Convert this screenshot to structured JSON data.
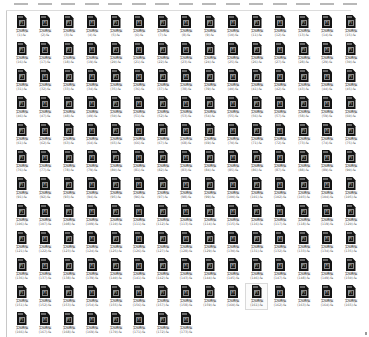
{
  "view": {
    "type": "file-explorer-icon-grid",
    "columns": 15,
    "hovered_item_index": 160
  },
  "file": {
    "base_name": "实验数据",
    "extension": ".fa",
    "icon": "fasta-file-icon",
    "icon_glyph": "Fl"
  },
  "items": [
    {
      "line1": "实验数据",
      "line2": "(1).fa"
    },
    {
      "line1": "实验数据",
      "line2": "(2).fa"
    },
    {
      "line1": "实验数据",
      "line2": "(3).fa"
    },
    {
      "line1": "实验数据",
      "line2": "(4).fa"
    },
    {
      "line1": "实验数据",
      "line2": "(5).fa"
    },
    {
      "line1": "实验数据",
      "line2": "(6).fa"
    },
    {
      "line1": "实验数据",
      "line2": "(7).fa"
    },
    {
      "line1": "实验数据",
      "line2": "(8).fa"
    },
    {
      "line1": "实验数据",
      "line2": "(9).fa"
    },
    {
      "line1": "实验数据",
      "line2": "(10).fa"
    },
    {
      "line1": "实验数据",
      "line2": "(11).fa"
    },
    {
      "line1": "实验数据",
      "line2": "(12).fa"
    },
    {
      "line1": "实验数据",
      "line2": "(13).fa"
    },
    {
      "line1": "实验数据",
      "line2": "(14).fa"
    },
    {
      "line1": "实验数据",
      "line2": "(15).fa"
    },
    {
      "line1": "实验数据",
      "line2": "(16).fa"
    },
    {
      "line1": "实验数据",
      "line2": "(17).fa"
    },
    {
      "line1": "实验数据",
      "line2": "(18).fa"
    },
    {
      "line1": "实验数据",
      "line2": "(19).fa"
    },
    {
      "line1": "实验数据",
      "line2": "(20).fa"
    },
    {
      "line1": "实验数据",
      "line2": "(21).fa"
    },
    {
      "line1": "实验数据",
      "line2": "(22).fa"
    },
    {
      "line1": "实验数据",
      "line2": "(23).fa"
    },
    {
      "line1": "实验数据",
      "line2": "(24).fa"
    },
    {
      "line1": "实验数据",
      "line2": "(25).fa"
    },
    {
      "line1": "实验数据",
      "line2": "(26).fa"
    },
    {
      "line1": "实验数据",
      "line2": "(27).fa"
    },
    {
      "line1": "实验数据",
      "line2": "(28).fa"
    },
    {
      "line1": "实验数据",
      "line2": "(29).fa"
    },
    {
      "line1": "实验数据",
      "line2": "(30).fa"
    },
    {
      "line1": "实验数据",
      "line2": "(31).fa"
    },
    {
      "line1": "实验数据",
      "line2": "(32).fa"
    },
    {
      "line1": "实验数据",
      "line2": "(33).fa"
    },
    {
      "line1": "实验数据",
      "line2": "(34).fa"
    },
    {
      "line1": "实验数据",
      "line2": "(35).fa"
    },
    {
      "line1": "实验数据",
      "line2": "(36).fa"
    },
    {
      "line1": "实验数据",
      "line2": "(37).fa"
    },
    {
      "line1": "实验数据",
      "line2": "(38).fa"
    },
    {
      "line1": "实验数据",
      "line2": "(39).fa"
    },
    {
      "line1": "实验数据",
      "line2": "(40).fa"
    },
    {
      "line1": "实验数据",
      "line2": "(41).fa"
    },
    {
      "line1": "实验数据",
      "line2": "(42).fa"
    },
    {
      "line1": "实验数据",
      "line2": "(43).fa"
    },
    {
      "line1": "实验数据",
      "line2": "(44).fa"
    },
    {
      "line1": "实验数据",
      "line2": "(45).fa"
    },
    {
      "line1": "实验数据",
      "line2": "(46).fa"
    },
    {
      "line1": "实验数据",
      "line2": "(47).fa"
    },
    {
      "line1": "实验数据",
      "line2": "(48).fa"
    },
    {
      "line1": "实验数据",
      "line2": "(49).fa"
    },
    {
      "line1": "实验数据",
      "line2": "(50).fa"
    },
    {
      "line1": "实验数据",
      "line2": "(51).fa"
    },
    {
      "line1": "实验数据",
      "line2": "(52).fa"
    },
    {
      "line1": "实验数据",
      "line2": "(53).fa"
    },
    {
      "line1": "实验数据",
      "line2": "(54).fa"
    },
    {
      "line1": "实验数据",
      "line2": "(55).fa"
    },
    {
      "line1": "实验数据",
      "line2": "(56).fa"
    },
    {
      "line1": "实验数据",
      "line2": "(57).fa"
    },
    {
      "line1": "实验数据",
      "line2": "(58).fa"
    },
    {
      "line1": "实验数据",
      "line2": "(59).fa"
    },
    {
      "line1": "实验数据",
      "line2": "(60).fa"
    },
    {
      "line1": "实验数据",
      "line2": "(61).fa"
    },
    {
      "line1": "实验数据",
      "line2": "(62).fa"
    },
    {
      "line1": "实验数据",
      "line2": "(63).fa"
    },
    {
      "line1": "实验数据",
      "line2": "(64).fa"
    },
    {
      "line1": "实验数据",
      "line2": "(65).fa"
    },
    {
      "line1": "实验数据",
      "line2": "(66).fa"
    },
    {
      "line1": "实验数据",
      "line2": "(67).fa"
    },
    {
      "line1": "实验数据",
      "line2": "(68).fa"
    },
    {
      "line1": "实验数据",
      "line2": "(69).fa"
    },
    {
      "line1": "实验数据",
      "line2": "(70).fa"
    },
    {
      "line1": "实验数据",
      "line2": "(71).fa"
    },
    {
      "line1": "实验数据",
      "line2": "(72).fa"
    },
    {
      "line1": "实验数据",
      "line2": "(73).fa"
    },
    {
      "line1": "实验数据",
      "line2": "(74).fa"
    },
    {
      "line1": "实验数据",
      "line2": "(75).fa"
    },
    {
      "line1": "实验数据",
      "line2": "(76).fa"
    },
    {
      "line1": "实验数据",
      "line2": "(77).fa"
    },
    {
      "line1": "实验数据",
      "line2": "(78).fa"
    },
    {
      "line1": "实验数据",
      "line2": "(79).fa"
    },
    {
      "line1": "实验数据",
      "line2": "(80).fa"
    },
    {
      "line1": "实验数据",
      "line2": "(81).fa"
    },
    {
      "line1": "实验数据",
      "line2": "(82).fa"
    },
    {
      "line1": "实验数据",
      "line2": "(83).fa"
    },
    {
      "line1": "实验数据",
      "line2": "(84).fa"
    },
    {
      "line1": "实验数据",
      "line2": "(85).fa"
    },
    {
      "line1": "实验数据",
      "line2": "(86).fa"
    },
    {
      "line1": "实验数据",
      "line2": "(87).fa"
    },
    {
      "line1": "实验数据",
      "line2": "(88).fa"
    },
    {
      "line1": "实验数据",
      "line2": "(89).fa"
    },
    {
      "line1": "实验数据",
      "line2": "(90).fa"
    },
    {
      "line1": "实验数据",
      "line2": "(91).fa"
    },
    {
      "line1": "实验数据",
      "line2": "(92).fa"
    },
    {
      "line1": "实验数据",
      "line2": "(93).fa"
    },
    {
      "line1": "实验数据",
      "line2": "(94).fa"
    },
    {
      "line1": "实验数据",
      "line2": "(95).fa"
    },
    {
      "line1": "实验数据",
      "line2": "(96).fa"
    },
    {
      "line1": "实验数据",
      "line2": "(97).fa"
    },
    {
      "line1": "实验数据",
      "line2": "(98).fa"
    },
    {
      "line1": "实验数据",
      "line2": "(99).fa"
    },
    {
      "line1": "实验数据",
      "line2": "(100).fa"
    },
    {
      "line1": "实验数据",
      "line2": "(101).fa"
    },
    {
      "line1": "实验数据",
      "line2": "(102).fa"
    },
    {
      "line1": "实验数据",
      "line2": "(103).fa"
    },
    {
      "line1": "实验数据",
      "line2": "(104).fa"
    },
    {
      "line1": "实验数据",
      "line2": "(105).fa"
    },
    {
      "line1": "实验数据",
      "line2": "(106).fa"
    },
    {
      "line1": "实验数据",
      "line2": "(107).fa"
    },
    {
      "line1": "实验数据",
      "line2": "(108).fa"
    },
    {
      "line1": "实验数据",
      "line2": "(109).fa"
    },
    {
      "line1": "实验数据",
      "line2": "(110).fa"
    },
    {
      "line1": "实验数据",
      "line2": "(111).fa"
    },
    {
      "line1": "实验数据",
      "line2": "(112).fa"
    },
    {
      "line1": "实验数据",
      "line2": "(113).fa"
    },
    {
      "line1": "实验数据",
      "line2": "(114).fa"
    },
    {
      "line1": "实验数据",
      "line2": "(115).fa"
    },
    {
      "line1": "实验数据",
      "line2": "(116).fa"
    },
    {
      "line1": "实验数据",
      "line2": "(117).fa"
    },
    {
      "line1": "实验数据",
      "line2": "(118).fa"
    },
    {
      "line1": "实验数据",
      "line2": "(119).fa"
    },
    {
      "line1": "实验数据",
      "line2": "(120).fa"
    },
    {
      "line1": "实验数据",
      "line2": "(121).fa"
    },
    {
      "line1": "实验数据",
      "line2": "(122).fa"
    },
    {
      "line1": "实验数据",
      "line2": "(123).fa"
    },
    {
      "line1": "实验数据",
      "line2": "(124).fa"
    },
    {
      "line1": "实验数据",
      "line2": "(125).fa"
    },
    {
      "line1": "实验数据",
      "line2": "(126).fa"
    },
    {
      "line1": "实验数据",
      "line2": "(127).fa"
    },
    {
      "line1": "实验数据",
      "line2": "(128).fa"
    },
    {
      "line1": "实验数据",
      "line2": "(129).fa"
    },
    {
      "line1": "实验数据",
      "line2": "(130).fa"
    },
    {
      "line1": "实验数据",
      "line2": "(131).fa"
    },
    {
      "line1": "实验数据",
      "line2": "(132).fa"
    },
    {
      "line1": "实验数据",
      "line2": "(133).fa"
    },
    {
      "line1": "实验数据",
      "line2": "(134).fa"
    },
    {
      "line1": "实验数据",
      "line2": "(135).fa"
    },
    {
      "line1": "实验数据",
      "line2": "(136).fa"
    },
    {
      "line1": "实验数据",
      "line2": "(137).fa"
    },
    {
      "line1": "实验数据",
      "line2": "(138).fa"
    },
    {
      "line1": "实验数据",
      "line2": "(139).fa"
    },
    {
      "line1": "实验数据",
      "line2": "(140).fa"
    },
    {
      "line1": "实验数据",
      "line2": "(141).fa"
    },
    {
      "line1": "实验数据",
      "line2": "(142).fa"
    },
    {
      "line1": "实验数据",
      "line2": "(143).fa"
    },
    {
      "line1": "实验数据",
      "line2": "(144).fa"
    },
    {
      "line1": "实验数据",
      "line2": "(145).fa"
    },
    {
      "line1": "实验数据",
      "line2": "(146).fa"
    },
    {
      "line1": "实验数据",
      "line2": "(147).fa"
    },
    {
      "line1": "实验数据",
      "line2": "(148).fa"
    },
    {
      "line1": "实验数据",
      "line2": "(149).fa"
    },
    {
      "line1": "实验数据",
      "line2": "(150).fa"
    },
    {
      "line1": "实验数据",
      "line2": "(151).fa"
    },
    {
      "line1": "实验数据",
      "line2": "(152).fa"
    },
    {
      "line1": "实验数据",
      "line2": "(153).fa"
    },
    {
      "line1": "实验数据",
      "line2": "(154).fa"
    },
    {
      "line1": "实验数据",
      "line2": "(155).fa"
    },
    {
      "line1": "实验数据",
      "line2": "(156).fa"
    },
    {
      "line1": "实验数据",
      "line2": "(157).fa"
    },
    {
      "line1": "实验数据",
      "line2": "(158).fa"
    },
    {
      "line1": "实验数据",
      "line2": "(159).fa"
    },
    {
      "line1": "实验数据",
      "line2": "(160).fa"
    },
    {
      "line1": "实验数据",
      "line2": "(161).fa"
    },
    {
      "line1": "实验数据",
      "line2": "(162).fa"
    },
    {
      "line1": "实验数据",
      "line2": "(163).fa"
    },
    {
      "line1": "实验数据",
      "line2": "(164).fa"
    },
    {
      "line1": "实验数据",
      "line2": "(165).fa"
    },
    {
      "line1": "实验数据",
      "line2": "(166).fa"
    },
    {
      "line1": "实验数据",
      "line2": "(167).fa"
    },
    {
      "line1": "实验数据",
      "line2": "(168).fa"
    },
    {
      "line1": "实验数据",
      "line2": "(169).fa"
    },
    {
      "line1": "实验数据",
      "line2": "(170).fa"
    },
    {
      "line1": "实验数据",
      "line2": "(171).fa"
    },
    {
      "line1": "实验数据",
      "line2": "(172).fa"
    },
    {
      "line1": "实验数据",
      "line2": "(173).fa"
    }
  ]
}
